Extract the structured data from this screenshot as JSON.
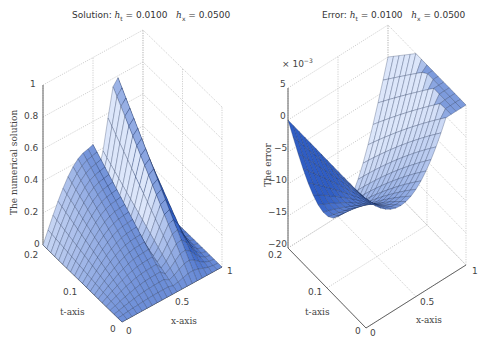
{
  "chart_data": [
    {
      "type": "surface",
      "title": "Solution: h_t = 0.0100    h_x = 0.0500",
      "title_parts": {
        "prefix": "Solution: ",
        "ht_label": "h",
        "ht_sub": "t",
        "ht_value": " = 0.0100",
        "hx_label": "h",
        "hx_sub": "x",
        "hx_value": " = 0.0500"
      },
      "xlabel": "x-axis",
      "ylabel": "t-axis",
      "zlabel": "The numerical solution",
      "x_ticks": [
        "0",
        "0.5",
        "1"
      ],
      "t_ticks": [
        "0",
        "0.1",
        "0.2"
      ],
      "z_ticks": [
        "0",
        "0.2",
        "0.4",
        "0.6",
        "0.8",
        "1"
      ],
      "xlim": [
        0,
        1
      ],
      "tlim": [
        0,
        0.2
      ],
      "zlim": [
        0,
        1
      ],
      "grid": true,
      "colormap": "blue shaded",
      "description": "Surface u(x,t): sine-like profile in x decaying/shifting with t; peak ~0.7 near x=0.75 at t=0.2"
    },
    {
      "type": "surface",
      "title": "Error: h_t = 0.0100    h_x = 0.0500",
      "title_parts": {
        "prefix": "Error: ",
        "ht_label": "h",
        "ht_sub": "t",
        "ht_value": " = 0.0100",
        "hx_label": "h",
        "hx_sub": "x",
        "hx_value": " = 0.0500"
      },
      "xlabel": "x-axis",
      "ylabel": "t-axis",
      "zlabel": "The error",
      "scale_label": "× 10",
      "scale_exp": "−3",
      "x_ticks": [
        "0",
        "0.5",
        "1"
      ],
      "t_ticks": [
        "0",
        "0.1",
        "0.2"
      ],
      "z_ticks": [
        "−20",
        "−15",
        "−10",
        "−5",
        "0",
        "5"
      ],
      "xlim": [
        0,
        1
      ],
      "tlim": [
        0,
        0.2
      ],
      "zlim": [
        -0.02,
        0.005
      ],
      "grid": true,
      "colormap": "blue shaded",
      "description": "Error surface: zero at x=0 and x=1, minimum about -20e-3 near x=0.5 at t=0.2"
    }
  ],
  "colors": {
    "surface_dark": "#2f5dc4",
    "surface_mid": "#6a8fdc",
    "surface_light": "#dce6fa",
    "edge": "#1a2a55",
    "grid": "#bbbbbb",
    "axis": "#555555"
  }
}
